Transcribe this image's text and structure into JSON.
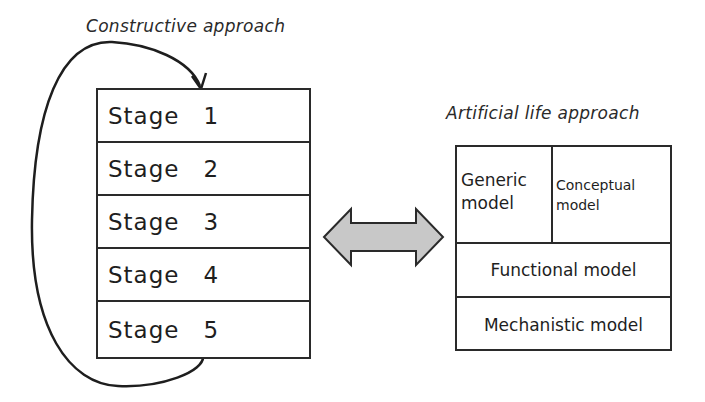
{
  "left": {
    "title": "Constructive approach",
    "stages": [
      {
        "label": "Stage",
        "num": "1"
      },
      {
        "label": "Stage",
        "num": "2"
      },
      {
        "label": "Stage",
        "num": "3"
      },
      {
        "label": "Stage",
        "num": "4"
      },
      {
        "label": "Stage",
        "num": "5"
      }
    ],
    "loop_arrow": "feedback from Stage 5 back to Stage 1"
  },
  "connector": {
    "type": "double-headed-arrow",
    "fill": "#c8c8c8"
  },
  "right": {
    "title": "Artificial life approach",
    "models": {
      "generic": "Generic model",
      "generic_line1": "Generic",
      "generic_line2": "model",
      "conceptual_line1": "Conceptual",
      "conceptual_line2": "model",
      "functional": "Functional model",
      "mechanistic": "Mechanistic model"
    }
  }
}
